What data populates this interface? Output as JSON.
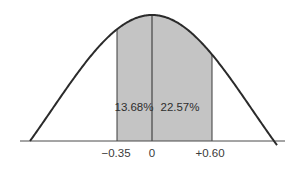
{
  "chart_data": {
    "type": "area",
    "title": "",
    "xlabel": "",
    "ylabel": "",
    "distribution": "standard normal curve",
    "mean": 0,
    "x_ticks": [
      "-0.35",
      "0",
      "+0.60"
    ],
    "x_tick_values": [
      -0.35,
      0,
      0.6
    ],
    "shaded_regions": [
      {
        "from": -0.35,
        "to": 0,
        "label": "13.68%",
        "value": 13.68
      },
      {
        "from": 0,
        "to": 0.6,
        "label": "22.57%",
        "value": 22.57
      }
    ],
    "grid": false,
    "legend": null
  },
  "colors": {
    "curve": "#2b2b2b",
    "shade": "#c4c4c4",
    "axis": "#4a4a4a",
    "text": "#333333"
  },
  "labels": {
    "tick_neg": "−0.35",
    "tick_zero": "0",
    "tick_pos": "+0.60",
    "region_left": "13.68%",
    "region_right": "22.57%"
  }
}
